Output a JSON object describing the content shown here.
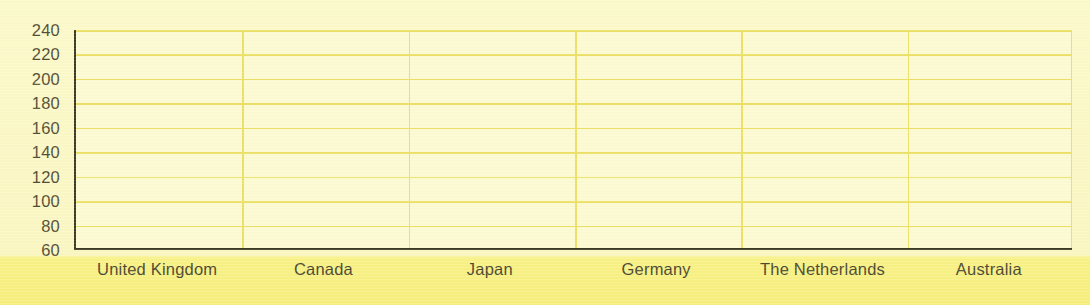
{
  "chart_data": {
    "type": "bar",
    "title": "",
    "subtitle": "",
    "xlabel": "",
    "ylabel": "",
    "categories": [
      "United Kingdom",
      "Canada",
      "Japan",
      "Germany",
      "The Netherlands",
      "Australia"
    ],
    "values": [
      null,
      null,
      null,
      null,
      null,
      null
    ],
    "series": [],
    "ylim": [
      60,
      240
    ],
    "ytick_step": 20,
    "yticks": [
      240,
      220,
      200,
      180,
      160,
      140,
      120,
      100,
      80,
      60
    ],
    "grid": true,
    "grid_horizontal": true,
    "grid_vertical": true,
    "legend": false,
    "legend_position": "none",
    "annotations": [],
    "note": "Empty plot frame - gridlines and axis labels only, no data plotted"
  },
  "colors": {
    "page_background": "#fcfacb",
    "band_background": "#f8f083",
    "plot_background": "#fdfbd2",
    "gridline": "#ece066",
    "axis_line": "#3c3a25",
    "ytick_text": "#534f35",
    "xtick_text": "#4c4830"
  }
}
